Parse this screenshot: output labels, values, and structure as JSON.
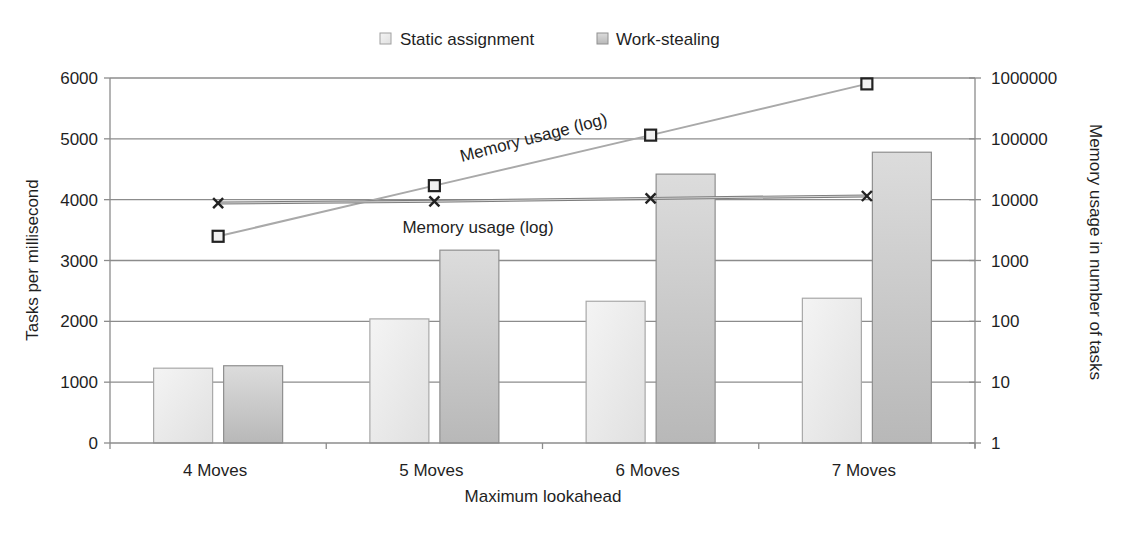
{
  "chart_data": {
    "type": "bar",
    "title": "",
    "xlabel": "Maximum lookahead",
    "ylabel": "Tasks per millisecond",
    "y2label": "Memory usage in number of tasks",
    "categories": [
      "4 Moves",
      "5 Moves",
      "6 Moves",
      "7 Moves"
    ],
    "ylim": [
      0,
      6000
    ],
    "yticks": [
      0,
      1000,
      2000,
      3000,
      4000,
      5000,
      6000
    ],
    "y2scale": "log",
    "y2lim": [
      1,
      1000000
    ],
    "y2ticks": [
      1,
      10,
      100,
      1000,
      10000,
      100000,
      1000000
    ],
    "grid": true,
    "legend": {
      "position": "top-center",
      "entries": [
        {
          "name": "Static assignment",
          "color": "#e8e8e8"
        },
        {
          "name": "Work-stealing",
          "color": "#c4c4c4"
        }
      ]
    },
    "series": [
      {
        "name": "Static assignment",
        "type": "bar",
        "axis": "left",
        "values": [
          1230,
          2040,
          2330,
          2380
        ],
        "color": "#e9e9e9"
      },
      {
        "name": "Work-stealing",
        "type": "bar",
        "axis": "left",
        "values": [
          1270,
          3170,
          4420,
          4780
        ],
        "color": "#c8c8c8"
      },
      {
        "name": "Memory usage (log)",
        "type": "line",
        "axis": "right",
        "marker": "square",
        "values": [
          2500,
          17000,
          115000,
          800000
        ],
        "color": "#a8a8a8",
        "label": "Memory usage (log)"
      },
      {
        "name": "Memory usage (log)",
        "type": "line",
        "axis": "right",
        "marker": "x",
        "values": [
          8800,
          9400,
          10500,
          11500
        ],
        "color": "#888888",
        "label": "Memory usage (log)"
      }
    ],
    "annotations": [
      {
        "text": "Memory usage (log)",
        "attached_to": "square-series",
        "rotated": true
      },
      {
        "text": "Memory usage (log)",
        "attached_to": "x-series",
        "rotated": false
      }
    ]
  }
}
